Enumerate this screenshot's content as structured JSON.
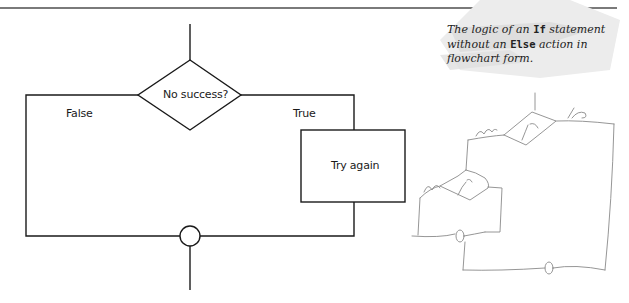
{
  "caption": {
    "part1": "The logic of an ",
    "code1": "If",
    "part2": " statement without an ",
    "code2": "Else",
    "part3": " action in flowchart form."
  },
  "flowchart": {
    "decision": {
      "label": "No success?"
    },
    "branches": {
      "false_label": "False",
      "true_label": "True"
    },
    "process": {
      "label": "Try again"
    },
    "connector": {
      "shape": "circle"
    }
  },
  "sketch": {
    "upper_decision": {
      "label": "if",
      "left_label": "else",
      "right_label": "the"
    },
    "lower_decision": {
      "label": "if",
      "left_label": "else"
    }
  },
  "colors": {
    "line": "#1a1a1a",
    "sketch": "#8a8a8a",
    "rule": "#7a7a7a"
  }
}
